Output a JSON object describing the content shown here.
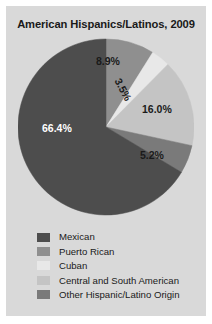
{
  "chart_data": {
    "type": "pie",
    "title": "American Hispanics/Latinos, 2009",
    "categories": [
      "Mexican",
      "Puerto Rican",
      "Cuban",
      "Central and South American",
      "Other Hispanic/Latino Origin"
    ],
    "values": [
      66.4,
      8.9,
      3.5,
      16.0,
      5.2
    ],
    "value_labels": [
      "66.4%",
      "8.9%",
      "3.5%",
      "16.0%",
      "5.2%"
    ],
    "colors": [
      "#4d4d4d",
      "#8f8f8f",
      "#e8e8e8",
      "#c4c4c4",
      "#7a7a7a"
    ],
    "start_angle_deg": 0,
    "direction": "clockwise",
    "legend_position": "bottom",
    "grid": false,
    "xlabel": "",
    "ylabel": ""
  },
  "figure": {
    "background": "#d9d9d9",
    "slices": [
      {
        "label": "8.9%",
        "value": 8.9,
        "color": "#8f8f8f",
        "category": "Puerto Rican",
        "label_on_dark": false
      },
      {
        "label": "3.5%",
        "value": 3.5,
        "color": "#e8e8e8",
        "category": "Cuban",
        "label_on_dark": false
      },
      {
        "label": "16.0%",
        "value": 16.0,
        "color": "#c4c4c4",
        "category": "Central and South American",
        "label_on_dark": false
      },
      {
        "label": "5.2%",
        "value": 5.2,
        "color": "#7a7a7a",
        "category": "Other Hispanic/Latino Origin",
        "label_on_dark": false
      },
      {
        "label": "66.4%",
        "value": 66.4,
        "color": "#4d4d4d",
        "category": "Mexican",
        "label_on_dark": true
      }
    ]
  },
  "legend": {
    "items": [
      {
        "label": "Mexican",
        "color": "#4d4d4d"
      },
      {
        "label": "Puerto Rican",
        "color": "#8f8f8f"
      },
      {
        "label": "Cuban",
        "color": "#e8e8e8"
      },
      {
        "label": "Central and South American",
        "color": "#c4c4c4"
      },
      {
        "label": "Other Hispanic/Latino Origin",
        "color": "#7a7a7a"
      }
    ]
  }
}
